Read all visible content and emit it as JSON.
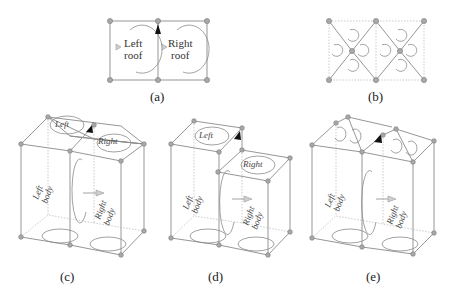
{
  "figure": {
    "panels": [
      {
        "id": "a",
        "caption": "(a)",
        "view": "top",
        "regions": [
          "Left roof",
          "Right roof"
        ]
      },
      {
        "id": "b",
        "caption": "(b)",
        "view": "top",
        "regions": []
      },
      {
        "id": "c",
        "caption": "(c)",
        "view": "3d",
        "regions": [
          "Left roof",
          "Right roof",
          "Left body",
          "Right body"
        ]
      },
      {
        "id": "d",
        "caption": "(d)",
        "view": "3d",
        "regions": [
          "Left roof",
          "Right roof",
          "Left body",
          "Right body"
        ]
      },
      {
        "id": "e",
        "caption": "(e)",
        "view": "3d",
        "regions": [
          "Left body",
          "Right body"
        ]
      }
    ]
  },
  "labels": {
    "a_left_1": "Left",
    "a_left_2": "roof",
    "a_right_1": "Right",
    "a_right_2": "roof",
    "left_roof_1": "Left",
    "left_roof_2": "roof",
    "right_roof_1": "Right",
    "right_roof_2": "roof",
    "left_body_1": "Left",
    "left_body_2": "body",
    "right_body_1": "Right",
    "right_body_2": "body",
    "face_marker": "F"
  },
  "colors": {
    "edge": "#8a8a8a",
    "node": "#a8a8a8",
    "arrow_fill": "#cfcfcf",
    "arrow_black": "#111111"
  }
}
